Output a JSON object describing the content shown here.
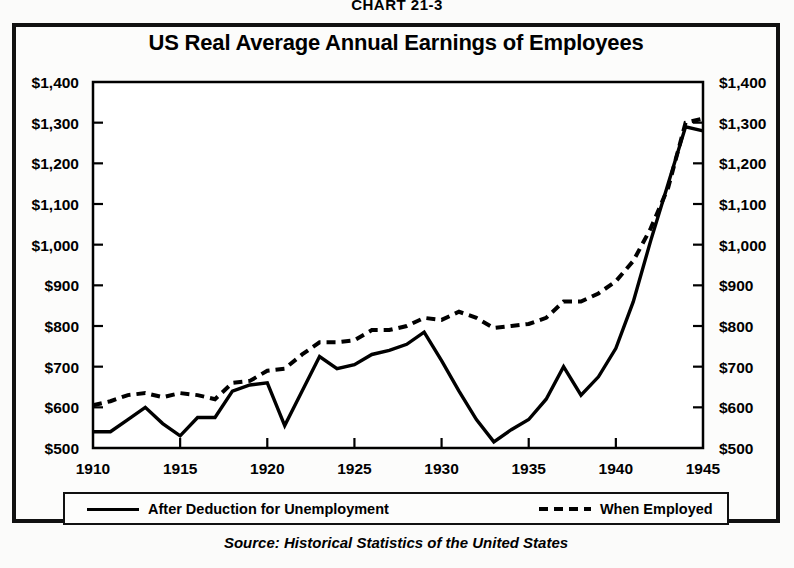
{
  "figure": {
    "chart_number": "CHART 21-3",
    "source": "Source:  Historical Statistics of the United States"
  },
  "legend": {
    "items": [
      {
        "label": "After Deduction for Unemployment",
        "style": "solid"
      },
      {
        "label": "When Employed",
        "style": "dashed"
      }
    ]
  },
  "chart_data": {
    "type": "line",
    "title": "US Real Average Annual Earnings of Employees",
    "xlabel": "",
    "ylabel": "",
    "xlim": [
      1910,
      1945
    ],
    "ylim": [
      500,
      1400
    ],
    "grid": false,
    "legend_position": "bottom",
    "y_tick_labels": [
      "$1,400",
      "$1,300",
      "$1,200",
      "$1,100",
      "$1,000",
      "$900",
      "$800",
      "$700",
      "$600",
      "$500"
    ],
    "y_ticks": [
      1400,
      1300,
      1200,
      1100,
      1000,
      900,
      800,
      700,
      600,
      500
    ],
    "x_tick_labels": [
      "1910",
      "1915",
      "1920",
      "1925",
      "1930",
      "1935",
      "1940",
      "1945"
    ],
    "x_ticks": [
      1910,
      1915,
      1920,
      1925,
      1930,
      1935,
      1940,
      1945
    ],
    "x": [
      1910,
      1911,
      1912,
      1913,
      1914,
      1915,
      1916,
      1917,
      1918,
      1919,
      1920,
      1921,
      1922,
      1923,
      1924,
      1925,
      1926,
      1927,
      1928,
      1929,
      1930,
      1931,
      1932,
      1933,
      1934,
      1935,
      1936,
      1937,
      1938,
      1939,
      1940,
      1941,
      1942,
      1943,
      1944,
      1945
    ],
    "series": [
      {
        "name": "After Deduction for Unemployment",
        "style": "solid",
        "values": [
          540,
          540,
          570,
          600,
          560,
          530,
          575,
          575,
          640,
          655,
          660,
          555,
          640,
          725,
          695,
          705,
          730,
          740,
          755,
          785,
          715,
          640,
          570,
          515,
          545,
          570,
          620,
          700,
          630,
          675,
          745,
          860,
          1010,
          1150,
          1290,
          1280
        ]
      },
      {
        "name": "When Employed",
        "style": "dashed",
        "values": [
          605,
          615,
          630,
          635,
          625,
          635,
          630,
          620,
          660,
          665,
          690,
          695,
          730,
          760,
          760,
          765,
          790,
          790,
          800,
          820,
          815,
          835,
          820,
          795,
          800,
          805,
          820,
          860,
          860,
          880,
          910,
          960,
          1040,
          1140,
          1300,
          1310
        ]
      }
    ]
  }
}
